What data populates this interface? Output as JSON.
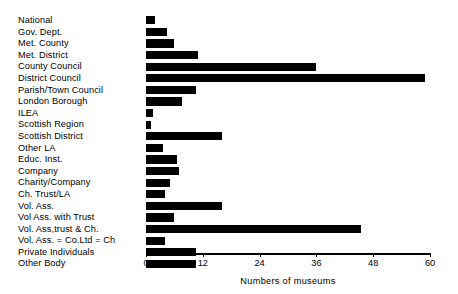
{
  "chart_data": {
    "type": "bar",
    "orientation": "horizontal",
    "title": "",
    "xlabel": "Numbers of museums",
    "ylabel": "",
    "xlim": [
      0,
      60
    ],
    "xticks": [
      0,
      12,
      24,
      36,
      48,
      60
    ],
    "grid": false,
    "legend": false,
    "bar_color": "#000000",
    "axis_color": "#000000",
    "background": "#ffffff",
    "categories": [
      "National",
      "Gov. Dept.",
      "Met. County",
      "Met. District",
      "County Council",
      "District Council",
      "Parish/Town Council",
      "London Borough",
      "ILEA",
      "Scottish Region",
      "Scottish District",
      "Other LA",
      "Educ. Inst.",
      "Company",
      "Charity/Company",
      "Ch. Trust/LA",
      "Vol. Ass.",
      "Vol Ass. with Trust",
      "Vol. Ass,trust & Ch.",
      "Vol. Ass. = Co.Ltd = Ch",
      "Private Individuals",
      "Other Body"
    ],
    "values": [
      2,
      4.5,
      6,
      11,
      36,
      59,
      10.5,
      7.5,
      1.5,
      1,
      16,
      3.5,
      6.5,
      7,
      5,
      4,
      16,
      6,
      45.5,
      4,
      10.5,
      10.5
    ]
  }
}
